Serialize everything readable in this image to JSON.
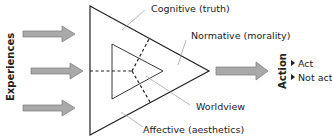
{
  "diagram": {
    "left_label": "Experiences",
    "right_label": "Action",
    "action_options": [
      "Act",
      "Not act"
    ],
    "regions": {
      "cognitive": "Cognitive (truth)",
      "normative": "Normative (morality)",
      "affective": "Affective (aesthetics)",
      "worldview": "Worldview"
    },
    "colors": {
      "arrow_fill": "#a9a9a9",
      "arrow_stroke": "#7a7a7a",
      "line": "#222222",
      "leader": "#999999"
    }
  }
}
